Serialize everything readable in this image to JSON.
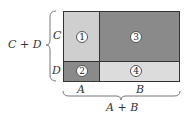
{
  "diagram": {
    "cells": [
      {
        "id": "1",
        "label": "1",
        "color": "#cfcfcf"
      },
      {
        "id": "2",
        "label": "2",
        "color": "#8a8a8a"
      },
      {
        "id": "3",
        "label": "3",
        "color": "#8a8a8a"
      },
      {
        "id": "4",
        "label": "4",
        "color": "#dcdcdc"
      }
    ],
    "row_labels": {
      "top": "C",
      "bottom": "D"
    },
    "col_labels": {
      "left": "A",
      "right": "B"
    },
    "left_brace_label": "C + D",
    "bottom_brace_label": "A + B"
  }
}
